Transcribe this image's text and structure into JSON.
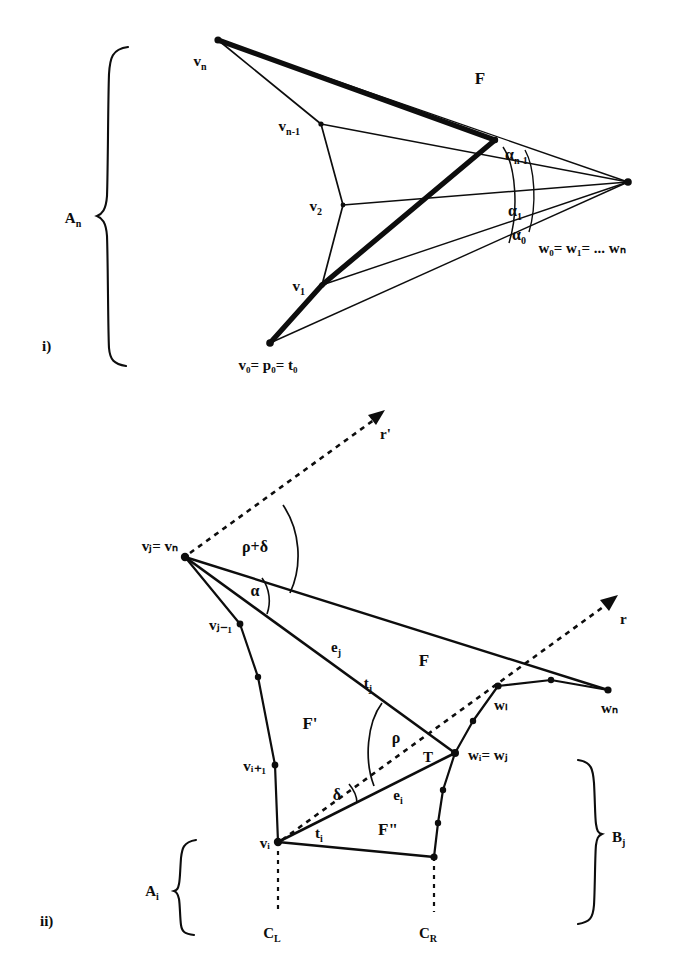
{
  "figure": {
    "panels": [
      {
        "id": "i",
        "caption": "i)",
        "brace_label": "A",
        "brace_label_sub": "n",
        "vertices": [
          {
            "name": "v",
            "sub": "n",
            "x": 218,
            "y": 40
          },
          {
            "name": "v",
            "sub": "n-1",
            "x": 321,
            "y": 124
          },
          {
            "name": "v",
            "sub": "2",
            "x": 343,
            "y": 205
          },
          {
            "name": "v",
            "sub": "1",
            "x": 322,
            "y": 285
          }
        ],
        "base_label": {
          "text": "v₀= p₀= t₀",
          "x": 270,
          "y": 343
        },
        "apex_label": {
          "text": "w₀= w₁= ... wₙ",
          "x": 628,
          "y": 182
        },
        "face_label": "F",
        "angles": [
          {
            "text": "α",
            "sub": "n-1"
          },
          {
            "text": "α",
            "sub": "1"
          },
          {
            "text": "α",
            "sub": "0"
          }
        ]
      },
      {
        "id": "ii",
        "caption": "ii)",
        "left_brace_label": "A",
        "left_brace_label_sub": "i",
        "right_brace_label": "B",
        "right_brace_label_sub": "j",
        "rays": [
          {
            "name": "r'",
            "x": 383,
            "y": 412
          },
          {
            "name": "r",
            "x": 615,
            "y": 597
          }
        ],
        "vertices": [
          {
            "text": "vⱼ= vₙ",
            "x": 185,
            "y": 557
          },
          {
            "text": "vⱼ₋₁",
            "x": 240,
            "y": 624
          },
          {
            "text": "vᵢ₊₁",
            "x": 275,
            "y": 765
          },
          {
            "text": "vᵢ",
            "x": 278,
            "y": 842
          },
          {
            "text": "wₗ",
            "x": 498,
            "y": 686
          },
          {
            "text": "wₙ",
            "x": 608,
            "y": 690
          },
          {
            "text": "wᵢ= wⱼ",
            "x": 455,
            "y": 753
          }
        ],
        "angles": [
          {
            "text": "ρ+δ",
            "x": 255,
            "y": 545
          },
          {
            "text": "α",
            "x": 257,
            "y": 589
          },
          {
            "text": "ρ",
            "x": 397,
            "y": 736
          },
          {
            "text": "δ",
            "x": 338,
            "y": 794
          }
        ],
        "edges": [
          {
            "text": "e",
            "sub": "j",
            "x": 338,
            "y": 646
          },
          {
            "text": "t",
            "sub": "j",
            "x": 370,
            "y": 682
          },
          {
            "text": "e",
            "sub": "i",
            "x": 400,
            "y": 794
          },
          {
            "text": "t",
            "sub": "i",
            "x": 320,
            "y": 832
          }
        ],
        "faces": [
          {
            "text": "F",
            "x": 424,
            "y": 659
          },
          {
            "text": "F'",
            "x": 310,
            "y": 722
          },
          {
            "text": "F\"",
            "x": 388,
            "y": 828
          }
        ],
        "point_T": {
          "text": "T",
          "x": 428,
          "y": 756
        },
        "cuts": [
          {
            "text": "C",
            "sub": "L",
            "x": 278,
            "y": 930
          },
          {
            "text": "C",
            "sub": "R",
            "x": 434,
            "y": 930
          }
        ]
      }
    ],
    "colors": {
      "ink": "#0d0d0d",
      "background": "#ffffff"
    }
  }
}
